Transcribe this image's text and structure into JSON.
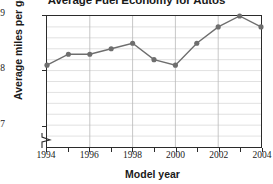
{
  "chart_data": {
    "type": "line",
    "title": "Average Fuel Economy for Autos",
    "xlabel": "Model year",
    "ylabel": "Average miles per gallon",
    "x": [
      1994,
      1995,
      1996,
      1997,
      1998,
      1999,
      2000,
      2001,
      2002,
      2003,
      2004
    ],
    "values": [
      28.1,
      28.3,
      28.3,
      28.4,
      28.5,
      28.2,
      28.1,
      28.5,
      28.8,
      29.0,
      28.8
    ],
    "xlim": [
      1994,
      2004
    ],
    "ylim": [
      26.6,
      29.0
    ],
    "ytick_labels": [
      "29",
      "28",
      "27"
    ],
    "ytick_values": [
      29,
      28,
      27
    ],
    "xtick_labels": [
      "1994",
      "1996",
      "1998",
      "2000",
      "2002",
      "2004"
    ],
    "xtick_values": [
      1994,
      1996,
      1998,
      2000,
      2002,
      2004
    ],
    "minor_gridline_step": 0.2,
    "grid": true,
    "legend": "none",
    "axis_break": true,
    "series_color": "#6e6e6e",
    "marker": "circle",
    "grid_color": "#d9d9d9",
    "axis_color": "#2b2b2b"
  }
}
